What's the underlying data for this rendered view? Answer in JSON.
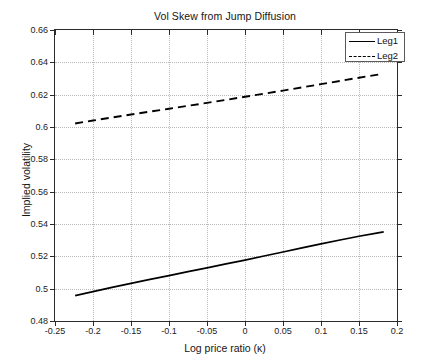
{
  "chart_data": {
    "type": "line",
    "title": "Vol Skew from Jump Diffusion",
    "xlabel": "Log price ratio (κ)",
    "ylabel": "Implied volatility",
    "xlim": [
      -0.25,
      0.2
    ],
    "ylim": [
      0.48,
      0.66
    ],
    "xticks": [
      -0.25,
      -0.2,
      -0.15,
      -0.1,
      -0.05,
      0,
      0.05,
      0.1,
      0.15,
      0.2
    ],
    "xticklabels": [
      "-0.25",
      "-0.2",
      "-0.15",
      "-0.1",
      "-0.05",
      "0",
      "0.05",
      "0.1",
      "0.15",
      "0.2"
    ],
    "yticks": [
      0.48,
      0.5,
      0.52,
      0.54,
      0.56,
      0.58,
      0.6,
      0.62,
      0.64,
      0.66
    ],
    "yticklabels": [
      "0.48",
      "0.5",
      "0.52",
      "0.54",
      "0.56",
      "0.58",
      "0.6",
      "0.62",
      "0.64",
      "0.66"
    ],
    "grid": true,
    "legend_position": "upper right",
    "legend": [
      "Leg1",
      "Leg2"
    ],
    "series": [
      {
        "name": "Leg1",
        "style": "solid",
        "color": "#000000",
        "x": [
          -0.2235,
          -0.2,
          -0.175,
          -0.15,
          -0.125,
          -0.1,
          -0.075,
          -0.05,
          -0.025,
          0.0,
          0.025,
          0.05,
          0.075,
          0.1,
          0.125,
          0.15,
          0.175,
          0.1825
        ],
        "y": [
          0.4957,
          0.4982,
          0.5008,
          0.5033,
          0.5057,
          0.5081,
          0.5105,
          0.5129,
          0.5153,
          0.5177,
          0.5202,
          0.5227,
          0.5252,
          0.5277,
          0.5301,
          0.5324,
          0.5345,
          0.5351
        ]
      },
      {
        "name": "Leg2",
        "style": "dashed",
        "color": "#000000",
        "x": [
          -0.2235,
          -0.2,
          -0.175,
          -0.15,
          -0.125,
          -0.1,
          -0.075,
          -0.05,
          -0.025,
          0.0,
          0.025,
          0.05,
          0.075,
          0.1,
          0.125,
          0.15,
          0.175,
          0.1785
        ],
        "y": [
          0.6022,
          0.604,
          0.6059,
          0.6077,
          0.6095,
          0.6113,
          0.6131,
          0.6149,
          0.6168,
          0.6187,
          0.6206,
          0.6225,
          0.6245,
          0.6265,
          0.6285,
          0.6305,
          0.6324,
          0.6327
        ]
      }
    ]
  }
}
